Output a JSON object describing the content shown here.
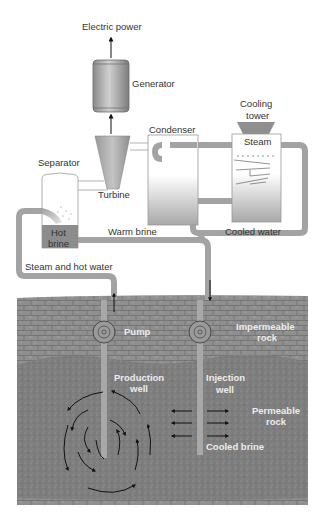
{
  "diagram": {
    "labels": {
      "electric_power": "Electric power",
      "generator": "Generator",
      "cooling": "Cooling",
      "tower": "tower",
      "condenser": "Condenser",
      "steam": "Steam",
      "separator": "Separator",
      "turbine": "Turbine",
      "hot": "Hot",
      "brine": "brine",
      "warm_brine": "Warm brine",
      "cooled_water": "Cooled water",
      "steam_hot_water": "Steam and hot water",
      "pump": "Pump",
      "impermeable": "Impermeable",
      "impermeable_rock": "rock",
      "production": "Production",
      "production_well": "well",
      "injection": "Injection",
      "injection_well": "well",
      "permeable": "Permeable",
      "permeable_rock": "rock",
      "cooled_brine": "Cooled brine"
    },
    "colors": {
      "pipe": "#a3a3a3",
      "pipe_edge": "#7f7f7f",
      "impermeable_rock": "#8e8e8e",
      "permeable_rock": "#7d7d7d",
      "hot_brine": "#8c8c8c",
      "arrow": "#111111"
    }
  }
}
